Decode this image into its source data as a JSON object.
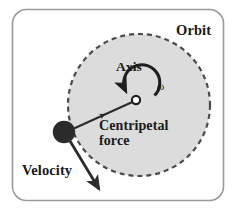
{
  "figure": {
    "frame": {
      "border_color": "#9a9a9a",
      "background": "#ffffff",
      "corner_radius": 14
    },
    "labels": {
      "orbit": "Orbit",
      "axis": "Axis",
      "omega": "ω",
      "centripetal_line1": "Centripetal",
      "centripetal_line2": "force",
      "velocity": "Velocity"
    },
    "colors": {
      "orbit_fill": "#dcdcdc",
      "orbit_dash": "#4a4a4a",
      "body": "#2b2b2b",
      "arrow": "#2b2b2b",
      "text": "#1a1a1a",
      "frame_border": "#9a9a9a"
    },
    "geometry": {
      "orbit_center_x": 139,
      "orbit_center_y": 105,
      "orbit_radius": 71,
      "orbit_dash_pattern": "5 4",
      "orbit_dash_width": 2.2,
      "axis_marker_x": 136,
      "axis_marker_y": 100,
      "axis_marker_radius": 4,
      "body_x": 64,
      "body_y": 132,
      "body_radius": 11,
      "centripetal_arrow_from": [
        75,
        127
      ],
      "centripetal_arrow_to": [
        133,
        102
      ],
      "velocity_arrow_from": [
        70,
        141
      ],
      "velocity_arrow_to": [
        100,
        192
      ],
      "rotation_arc_radius": 18,
      "rotation_direction": "counterclockwise"
    }
  }
}
